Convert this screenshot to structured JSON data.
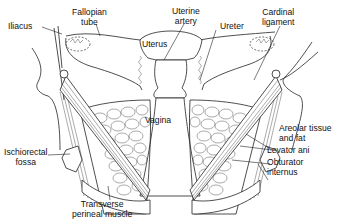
{
  "diagram": {
    "type": "anatomical line drawing",
    "labels": {
      "iliacus": "Iliacus",
      "fallopian_tube_1": "Fallopian",
      "fallopian_tube_2": "tube",
      "uterus": "Uterus",
      "uterine_artery_1": "Uterine",
      "uterine_artery_2": "artery",
      "ureter": "Ureter",
      "cardinal_ligament_1": "Cardinal",
      "cardinal_ligament_2": "ligament",
      "vagina": "Vagina",
      "areolar_tissue_1": "Areolar tissue",
      "areolar_tissue_2": "and fat",
      "levator_ani": "Levator ani",
      "obturator_internus_1": "Obturator",
      "obturator_internus_2": "internus",
      "ischiorectal_fossa_1": "Ischiorectal",
      "ischiorectal_fossa_2": "fossa",
      "transverse_perineal_1": "Transverse",
      "transverse_perineal_2": "perineal muscle"
    }
  }
}
